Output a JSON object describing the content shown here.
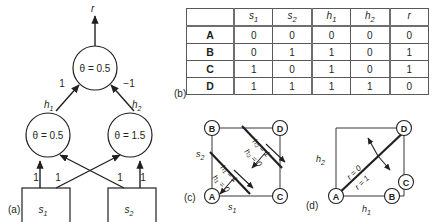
{
  "figure": {
    "panels": [
      {
        "id": "a",
        "label": "(a)"
      },
      {
        "id": "b",
        "label": "(b)"
      },
      {
        "id": "c",
        "label": "(c)"
      },
      {
        "id": "d",
        "label": "(d)"
      }
    ]
  },
  "network": {
    "output_unit": {
      "theta": "θ = 0.5",
      "output_label": "r"
    },
    "hidden_units": [
      {
        "name": "h",
        "sub": "1",
        "theta": "θ = 0.5"
      },
      {
        "name": "h",
        "sub": "2",
        "theta": "θ = 1.5"
      }
    ],
    "input_units": [
      {
        "name": "s",
        "sub": "1"
      },
      {
        "name": "s",
        "sub": "2"
      }
    ],
    "output_weights": [
      "1",
      "−1"
    ],
    "input_weights": [
      "1",
      "1",
      "1",
      "1"
    ]
  },
  "truth_table": {
    "corner": "",
    "columns": [
      {
        "name": "s",
        "sub": "1"
      },
      {
        "name": "s",
        "sub": "2"
      },
      {
        "name": "h",
        "sub": "1"
      },
      {
        "name": "h",
        "sub": "2"
      },
      {
        "name": "r",
        "sub": ""
      }
    ],
    "rows": [
      {
        "label": "A",
        "values": [
          "0",
          "0",
          "0",
          "0",
          "0"
        ]
      },
      {
        "label": "B",
        "values": [
          "0",
          "1",
          "1",
          "0",
          "1"
        ]
      },
      {
        "label": "C",
        "values": [
          "1",
          "0",
          "1",
          "0",
          "1"
        ]
      },
      {
        "label": "D",
        "values": [
          "1",
          "1",
          "1",
          "1",
          "0"
        ]
      }
    ]
  },
  "cube_c": {
    "corners": [
      {
        "id": "B",
        "label": "B",
        "position": "top-left"
      },
      {
        "id": "D",
        "label": "D",
        "position": "top-right"
      },
      {
        "id": "A",
        "label": "A",
        "position": "bottom-left"
      },
      {
        "id": "C",
        "label": "C",
        "position": "bottom-right"
      }
    ],
    "axes": [
      {
        "name": "s",
        "sub": "2",
        "position": "left"
      },
      {
        "name": "s",
        "sub": "1",
        "position": "bottom"
      }
    ],
    "decision_lines": [
      {
        "above": "h₂ = 1",
        "below": "h₂ = 0"
      },
      {
        "above": "h₁ = 1",
        "below": "h₁ = 0"
      }
    ]
  },
  "cube_d": {
    "corners": [
      {
        "id": "D",
        "label": "D",
        "position": "top-right"
      },
      {
        "id": "C",
        "label": "C",
        "position": "mid-right"
      },
      {
        "id": "B",
        "label": "B",
        "position": "bottom-right"
      },
      {
        "id": "A",
        "label": "A",
        "position": "bottom-left"
      }
    ],
    "axes": [
      {
        "name": "h",
        "sub": "2",
        "position": "left"
      },
      {
        "name": "h",
        "sub": "1",
        "position": "bottom"
      }
    ],
    "decision_lines": [
      {
        "above": "r = 0",
        "below": "r = 1"
      }
    ]
  },
  "colors": {
    "ink": "#231f20",
    "rule": "#58595b",
    "thick_rule": "#6d6e71",
    "background": "#ffffff"
  }
}
